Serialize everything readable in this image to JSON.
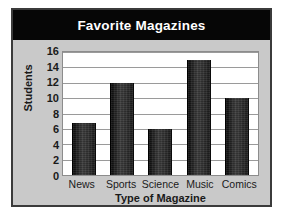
{
  "chart_data": {
    "type": "bar",
    "title": "Favorite Magazines",
    "xlabel": "Type of Magazine",
    "ylabel": "Students",
    "categories": [
      "News",
      "Sports",
      "Science",
      "Music",
      "Comics"
    ],
    "values": [
      6.8,
      12,
      6,
      15,
      10
    ],
    "ylim": [
      0,
      16
    ],
    "ytick_labels": [
      "16",
      "14",
      "12",
      "10",
      "8",
      "6",
      "4",
      "2",
      "0"
    ],
    "ytick_values": [
      16,
      14,
      12,
      10,
      8,
      6,
      4,
      2,
      0
    ],
    "ytick_step": 2,
    "grid": true,
    "legend": "none",
    "bar_color": "#2b2b2b",
    "plot_background": "#ffffff",
    "figure_background": "#c9c9c9",
    "title_banner_color": "#060606",
    "title_text_color": "#ffffff",
    "gridline_color": "#9a9a9a",
    "frame_color": "#3b3b3b"
  }
}
